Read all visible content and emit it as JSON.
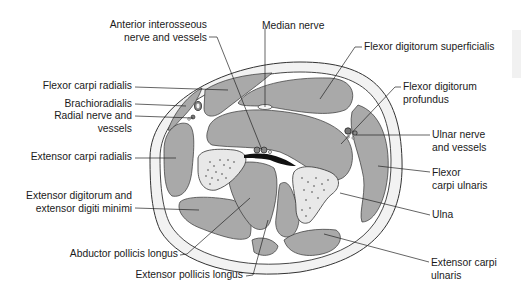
{
  "diagram": {
    "colors": {
      "muscle": "#a9a9a9",
      "fascia": "#ffffff",
      "skin_ring": "#f2f2f2",
      "outline": "#333333",
      "bone": "#e8e8e8",
      "vessel_dark": "#1a1a1a",
      "interosseous_membrane": "#111111",
      "leader": "#222222"
    }
  },
  "labels": [
    {
      "id": "anterior-interosseous",
      "lines": [
        "Anterior interosseous",
        "nerve and vessels"
      ],
      "x": 105,
      "y": 19,
      "w": 102,
      "align": "right"
    },
    {
      "id": "median-nerve",
      "lines": [
        "Median nerve"
      ],
      "x": 262,
      "y": 20,
      "w": 80,
      "align": "left"
    },
    {
      "id": "flexor-digitorum-superficialis",
      "lines": [
        "Flexor digitorum superficialis"
      ],
      "x": 364,
      "y": 41,
      "w": 150,
      "align": "left"
    },
    {
      "id": "flexor-carpi-radialis",
      "lines": [
        "Flexor carpi radialis"
      ],
      "x": 30,
      "y": 80,
      "w": 102,
      "align": "right"
    },
    {
      "id": "flexor-digitorum-profundus",
      "lines": [
        "Flexor digitorum",
        "profundus"
      ],
      "x": 403,
      "y": 81,
      "w": 100,
      "align": "left"
    },
    {
      "id": "brachioradialis",
      "lines": [
        "Brachioradialis"
      ],
      "x": 40,
      "y": 98,
      "w": 92,
      "align": "right"
    },
    {
      "id": "radial-nerve",
      "lines": [
        "Radial nerve and",
        "vessels"
      ],
      "x": 30,
      "y": 110,
      "w": 102,
      "align": "right"
    },
    {
      "id": "ulnar-nerve",
      "lines": [
        "Ulnar nerve",
        "and vessels"
      ],
      "x": 432,
      "y": 129,
      "w": 80,
      "align": "left"
    },
    {
      "id": "extensor-carpi-radialis",
      "lines": [
        "Extensor carpi radialis"
      ],
      "x": 20,
      "y": 151,
      "w": 112,
      "align": "right"
    },
    {
      "id": "flexor-carpi-ulnaris",
      "lines": [
        "Flexor",
        "carpi ulnaris"
      ],
      "x": 432,
      "y": 167,
      "w": 80,
      "align": "left"
    },
    {
      "id": "extensor-digitorum",
      "lines": [
        "Extensor digitorum and",
        "extensor digiti minimi"
      ],
      "x": 18,
      "y": 190,
      "w": 114,
      "align": "right"
    },
    {
      "id": "ulna",
      "lines": [
        "Ulna"
      ],
      "x": 432,
      "y": 209,
      "w": 40,
      "align": "left"
    },
    {
      "id": "abductor-pollicis-longus",
      "lines": [
        "Abductor pollicis longus"
      ],
      "x": 60,
      "y": 248,
      "w": 118,
      "align": "right"
    },
    {
      "id": "extensor-carpi-ulnaris",
      "lines": [
        "Extensor carpi",
        "ulnaris"
      ],
      "x": 431,
      "y": 257,
      "w": 90,
      "align": "left"
    },
    {
      "id": "extensor-pollicis-longus",
      "lines": [
        "Extensor pollicis longus"
      ],
      "x": 125,
      "y": 269,
      "w": 118,
      "align": "right"
    }
  ],
  "leaders": [
    {
      "id": "anterior-interosseous",
      "points": [
        [
          209,
          37
        ],
        [
          217,
          37
        ],
        [
          262,
          150
        ]
      ]
    },
    {
      "id": "median-nerve",
      "points": [
        [
          265,
          28
        ],
        [
          265,
          107
        ]
      ]
    },
    {
      "id": "flexor-digitorum-superficialis",
      "points": [
        [
          362,
          47
        ],
        [
          355,
          47
        ],
        [
          320,
          99
        ]
      ]
    },
    {
      "id": "flexor-carpi-radialis",
      "points": [
        [
          135,
          87
        ],
        [
          228,
          90
        ]
      ]
    },
    {
      "id": "flexor-digitorum-profundus",
      "points": [
        [
          401,
          87
        ],
        [
          395,
          87
        ],
        [
          341,
          144
        ]
      ]
    },
    {
      "id": "brachioradialis",
      "points": [
        [
          135,
          104
        ],
        [
          186,
          106
        ]
      ]
    },
    {
      "id": "radial-nerve",
      "points": [
        [
          135,
          116
        ],
        [
          193,
          118
        ]
      ]
    },
    {
      "id": "ulnar-nerve",
      "points": [
        [
          430,
          135
        ],
        [
          356,
          135
        ]
      ]
    },
    {
      "id": "extensor-carpi-radialis",
      "points": [
        [
          135,
          158
        ],
        [
          176,
          158
        ]
      ]
    },
    {
      "id": "flexor-carpi-ulnaris",
      "points": [
        [
          430,
          172
        ],
        [
          378,
          166
        ]
      ]
    },
    {
      "id": "extensor-digitorum",
      "points": [
        [
          135,
          208
        ],
        [
          199,
          210
        ]
      ]
    },
    {
      "id": "ulna",
      "points": [
        [
          430,
          215
        ],
        [
          340,
          193
        ]
      ]
    },
    {
      "id": "abductor-pollicis-longus",
      "points": [
        [
          180,
          255
        ],
        [
          187,
          254
        ],
        [
          250,
          198
        ]
      ]
    },
    {
      "id": "extensor-pollicis-longus",
      "points": [
        [
          246,
          276
        ],
        [
          253,
          275
        ],
        [
          268,
          220
        ]
      ]
    },
    {
      "id": "extensor-carpi-ulnaris",
      "points": [
        [
          429,
          262
        ],
        [
          324,
          234
        ]
      ]
    }
  ]
}
